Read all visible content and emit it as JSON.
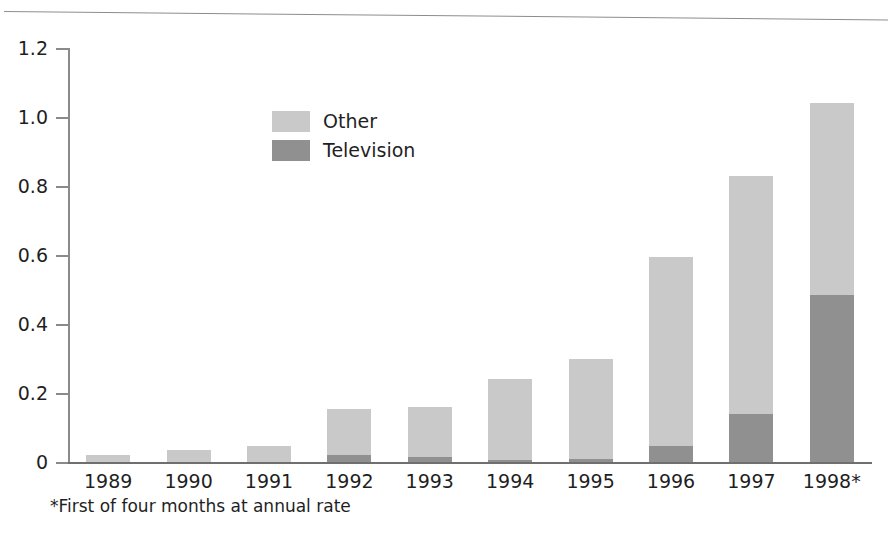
{
  "chart_data": {
    "type": "bar",
    "subtype": "stacked-vertical",
    "title": "",
    "subtitle": "",
    "xlabel": "",
    "ylabel": "",
    "categories": [
      "1989",
      "1990",
      "1991",
      "1992",
      "1993",
      "1994",
      "1995",
      "1996",
      "1997",
      "1998*"
    ],
    "series": [
      {
        "name": "Television",
        "color": "#909090",
        "values": [
          0,
          0,
          0,
          0.02,
          0.015,
          0.005,
          0.01,
          0.045,
          0.14,
          0.485
        ]
      },
      {
        "name": "Other",
        "color": "#c9c9c9",
        "values": [
          0.02,
          0.035,
          0.045,
          0.135,
          0.145,
          0.235,
          0.29,
          0.55,
          0.69,
          0.555
        ]
      }
    ],
    "stack_order_bottom_to_top": [
      "Television",
      "Other"
    ],
    "totals": [
      0.02,
      0.035,
      0.045,
      0.155,
      0.16,
      0.24,
      0.3,
      0.595,
      0.83,
      1.04
    ],
    "ylim": [
      0,
      1.2
    ],
    "yticks": [
      0,
      0.2,
      0.4,
      0.6,
      0.8,
      1.0,
      1.2
    ],
    "ytick_labels": [
      "0",
      "0.2",
      "0.4",
      "0.6",
      "0.8",
      "1.0",
      "1.2"
    ],
    "grid": false,
    "legend_position": "upper-center-left",
    "legend_entries": [
      {
        "label": "Other",
        "color": "#c9c9c9"
      },
      {
        "label": "Television",
        "color": "#909090"
      }
    ],
    "annotations": [
      "*First of four months at annual rate"
    ]
  },
  "legend": {
    "items": [
      {
        "label": "Other"
      },
      {
        "label": "Television"
      }
    ]
  },
  "footnote": {
    "text": "*First of four months at annual rate"
  },
  "axes": {
    "y_labels": [
      "1.2",
      "1.0",
      "0.8",
      "0.6",
      "0.4",
      "0.2",
      "0"
    ],
    "x_labels": [
      "1989",
      "1990",
      "1991",
      "1992",
      "1993",
      "1994",
      "1995",
      "1996",
      "1997",
      "1998*"
    ]
  }
}
